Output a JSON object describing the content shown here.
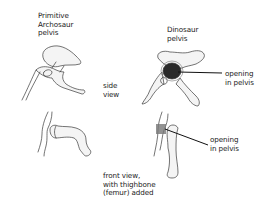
{
  "diagram": {
    "labels": {
      "primitive_title": "Primitive\nArchosaur\npelvis",
      "dinosaur_title": "Dinosaur\npelvis",
      "side_view": "side\nview",
      "front_view": "front view,\nwith thighbone\n(femur) added",
      "opening_side": "opening\nin pelvis",
      "opening_front": "opening\nin pelvis"
    },
    "colors": {
      "ink": "#3a3a3a",
      "opening_shade": "#2a2a2a",
      "background": "#ffffff"
    }
  }
}
